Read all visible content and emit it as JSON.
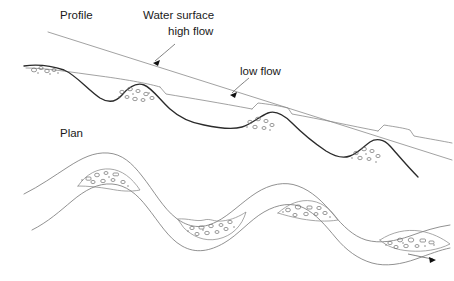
{
  "figure": {
    "background_color": "#ffffff",
    "width": 454,
    "height": 281
  },
  "labels": {
    "profile": "Profile",
    "plan": "Plan",
    "water_surface_line1": "Water surface",
    "water_surface_line2": "high flow",
    "low_flow": "low flow"
  },
  "colors": {
    "bed_line": "#2b2b2b",
    "water_surface_line": "#8a8a8a",
    "bank_line": "#7d7d7d",
    "gravel": "#6e6e6e",
    "text": "#1a1a1a",
    "arrow": "#111111"
  },
  "annotations": [
    {
      "name": "water-surface-high-flow",
      "text_line1": "Water surface",
      "text_line2": "high flow",
      "points_to": "upper sloping water surface line"
    },
    {
      "name": "low-flow",
      "text": "low flow",
      "points_to": "lower stepped water surface line"
    }
  ],
  "profile": {
    "view_label": "Profile",
    "description": "Longitudinal profile of a stream showing riffles and pools with a high flow water surface above a stepped low flow water surface, and a gravel bed.",
    "bed_path": "M 28 70 C 44 68 60 70 72 74 C 84 79 96 92 108 99 C 116 104 122 100 128 93 C 134 86 142 83 150 88 C 158 93 166 104 176 112 C 186 120 196 124 206 126 C 218 129 232 131 244 128 C 254 126 262 118 270 115 C 278 112 286 116 294 124 C 304 134 316 144 328 152 C 336 157 344 160 352 157 C 360 154 366 147 372 143 C 378 139 386 140 392 147 C 400 156 410 168 420 178",
    "high_flow_path": "M 48 32 L 454 160",
    "low_flow_segments": [
      "M 56 70 L 160 88 L 166 94 L 258 110",
      "M 258 110 L 266 104 L 288 108 L 292 113 L 380 131",
      "M 380 131 L 386 126 L 410 130 L 414 135 L 454 143"
    ],
    "riffle_bars": [
      {
        "name": "bar-1",
        "cx": 40,
        "cy": 73,
        "count": 6
      },
      {
        "name": "bar-2",
        "cx": 138,
        "cy": 98,
        "count": 11
      },
      {
        "name": "bar-3",
        "cx": 264,
        "cy": 124,
        "count": 8
      },
      {
        "name": "bar-4",
        "cx": 370,
        "cy": 155,
        "count": 9
      }
    ]
  },
  "plan": {
    "view_label": "Plan",
    "description": "Planform map of a meandering channel with two banks and alternating point bars of gravel on the inside of bends; flow is to the right.",
    "upper_bank_path": "M 28 193 C 42 186 54 178 66 170 C 78 162 90 156 104 156 C 118 156 130 164 140 176 C 152 190 160 206 172 216 C 184 226 198 228 212 222 C 226 216 238 204 252 195 C 266 186 282 182 296 186 C 310 190 322 200 332 212 C 342 224 352 234 364 238 C 378 243 394 241 408 236 C 420 232 432 228 446 226",
    "lower_bank_path": "M 36 228 C 50 220 62 210 74 200 C 86 190 98 182 112 182 C 126 182 138 190 148 202 C 160 216 170 232 184 240 C 198 248 212 246 226 238 C 240 230 252 216 266 208 C 280 200 294 198 306 204 C 318 210 328 222 338 234 C 348 246 360 256 374 260 C 388 264 404 262 418 258 C 430 254 440 250 450 248",
    "point_bars": [
      {
        "name": "point-bar-1",
        "cx": 106,
        "cy": 179,
        "count": 11
      },
      {
        "name": "point-bar-2",
        "cx": 212,
        "cy": 228,
        "count": 12
      },
      {
        "name": "point-bar-3",
        "cx": 310,
        "cy": 212,
        "count": 10
      },
      {
        "name": "point-bar-4",
        "cx": 412,
        "cy": 245,
        "count": 12
      }
    ],
    "flow_arrow": {
      "name": "flow-direction-arrow",
      "path": "M 410 252 L 436 258",
      "direction": "right"
    }
  }
}
